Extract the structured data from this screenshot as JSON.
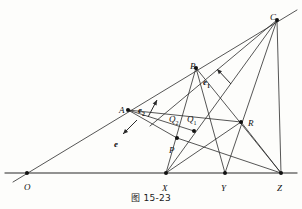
{
  "figure": {
    "caption": "图 15-23",
    "caption_y": 194,
    "width": 302,
    "height": 209,
    "line_color": "#2b2b2b",
    "baseline_color": "#6f6f6f",
    "dot_color": "#111111",
    "background": "#fdfdfb"
  },
  "points": [
    {
      "id": "O",
      "label": "O",
      "x": 27,
      "y": 173,
      "lx": 24,
      "ly": 183,
      "dot": true
    },
    {
      "id": "A",
      "label": "A",
      "x": 128,
      "y": 110,
      "lx": 119,
      "ly": 106,
      "dot": true
    },
    {
      "id": "B",
      "label": "B",
      "x": 196,
      "y": 68,
      "lx": 190,
      "ly": 62,
      "dot": true
    },
    {
      "id": "C",
      "label": "C",
      "x": 277,
      "y": 20,
      "lx": 270,
      "ly": 13,
      "dot": true
    },
    {
      "id": "X",
      "label": "X",
      "x": 166,
      "y": 173,
      "lx": 162,
      "ly": 184,
      "dot": true
    },
    {
      "id": "Y",
      "label": "Y",
      "x": 225,
      "y": 173,
      "lx": 221,
      "ly": 184,
      "dot": true
    },
    {
      "id": "Z",
      "label": "Z",
      "x": 281,
      "y": 173,
      "lx": 277,
      "ly": 184,
      "dot": true
    },
    {
      "id": "P",
      "label": "P",
      "x": 177,
      "y": 138,
      "lx": 169,
      "ly": 146,
      "dot": true
    },
    {
      "id": "Q2",
      "label": "Q",
      "sub": "2",
      "x": 180,
      "y": 134,
      "lx": 169,
      "ly": 115,
      "dot": false
    },
    {
      "id": "Q1",
      "label": "Q",
      "sub": "1",
      "x": 194,
      "y": 131,
      "lx": 187,
      "ly": 115,
      "dot": true
    },
    {
      "id": "R",
      "label": "R",
      "x": 241,
      "y": 122,
      "lx": 248,
      "ly": 119,
      "dot": true
    }
  ],
  "vectors": [
    {
      "id": "e",
      "label": "e",
      "sub": "",
      "x1": 137,
      "y1": 120,
      "x2": 123,
      "y2": 134,
      "lx": 114,
      "ly": 140
    },
    {
      "id": "e2",
      "label": "e",
      "sub": "2",
      "x1": 148,
      "y1": 117,
      "x2": 157,
      "y2": 100,
      "lx": 138,
      "ly": 106
    },
    {
      "id": "e1",
      "label": "e",
      "sub": "1",
      "x1": 231,
      "y1": 84,
      "x2": 217,
      "y2": 69,
      "lx": 203,
      "ly": 78
    }
  ],
  "segments": [
    {
      "name": "baseline-OZ",
      "x1": 5,
      "y1": 173,
      "x2": 297,
      "y2": 173,
      "style": "base"
    },
    {
      "name": "ray-O-C",
      "x1": 13,
      "y1": 182,
      "x2": 297,
      "y2": 10,
      "style": "thin"
    },
    {
      "name": "A-to-P",
      "x1": 128,
      "y1": 110,
      "x2": 177,
      "y2": 138,
      "style": "thin"
    },
    {
      "name": "A-to-R",
      "x1": 128,
      "y1": 110,
      "x2": 241,
      "y2": 122,
      "style": "thin"
    },
    {
      "name": "B-to-X",
      "x1": 196,
      "y1": 68,
      "x2": 166,
      "y2": 173,
      "style": "thin"
    },
    {
      "name": "B-to-Y",
      "x1": 196,
      "y1": 68,
      "x2": 225,
      "y2": 173,
      "style": "thin"
    },
    {
      "name": "B-to-Z",
      "x1": 196,
      "y1": 68,
      "x2": 281,
      "y2": 173,
      "style": "thin"
    },
    {
      "name": "C-to-X",
      "x1": 277,
      "y1": 20,
      "x2": 166,
      "y2": 173,
      "style": "thin"
    },
    {
      "name": "C-to-Y",
      "x1": 277,
      "y1": 20,
      "x2": 225,
      "y2": 173,
      "style": "thin"
    },
    {
      "name": "C-to-Z",
      "x1": 277,
      "y1": 20,
      "x2": 281,
      "y2": 173,
      "style": "thin"
    },
    {
      "name": "C-to-P",
      "x1": 277,
      "y1": 20,
      "x2": 150,
      "y2": 126,
      "style": "thin"
    },
    {
      "name": "X-to-R",
      "x1": 166,
      "y1": 173,
      "x2": 241,
      "y2": 122,
      "style": "thin"
    },
    {
      "name": "P-to-Z",
      "x1": 177,
      "y1": 138,
      "x2": 281,
      "y2": 173,
      "style": "thin"
    },
    {
      "name": "R-to-Z",
      "x1": 241,
      "y1": 122,
      "x2": 281,
      "y2": 173,
      "style": "thin"
    },
    {
      "name": "A-to-Q1-chord",
      "x1": 128,
      "y1": 110,
      "x2": 194,
      "y2": 131,
      "style": "thin"
    }
  ]
}
